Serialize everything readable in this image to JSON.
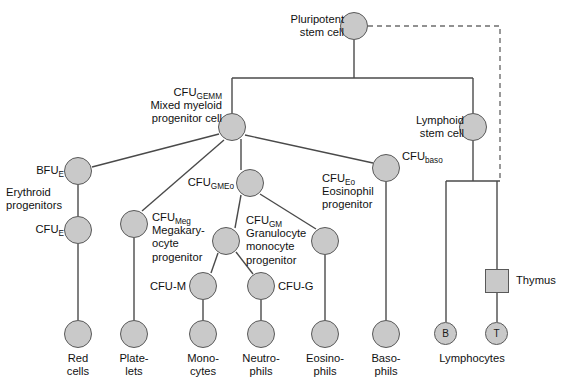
{
  "diagram": {
    "style": {
      "node_fill": "#c9c9c9",
      "node_stroke": "#595959",
      "line_color": "#4a4a4a",
      "dashed_line_color": "#6e6e6e",
      "background": "#ffffff"
    },
    "nodes": [
      {
        "id": "pluripotent",
        "label_main": "Pluripotent",
        "label_sub": "stem cell",
        "text": "Pluripotent\nstem cell",
        "shape": "circle",
        "cx": 354,
        "cy": 26,
        "r": 14,
        "label_x": 252,
        "label_y": 13,
        "label_w": 92,
        "align": "right"
      },
      {
        "id": "cfu-gemm",
        "text": "CFU",
        "subscript": "GEMM",
        "line2": "Mixed myeloid",
        "line3": "progenitor cell",
        "shape": "circle",
        "cx": 232,
        "cy": 127,
        "r": 14,
        "label_x": 112,
        "label_y": 86,
        "label_w": 110,
        "align": "right"
      },
      {
        "id": "lymphoid",
        "text": "Lymphoid\nstem cell",
        "shape": "circle",
        "cx": 473,
        "cy": 127,
        "r": 14,
        "label_x": 398,
        "label_y": 114,
        "label_w": 66,
        "align": "right"
      },
      {
        "id": "bfu-e",
        "text": "BFU",
        "subscript": "E",
        "shape": "circle",
        "cx": 78,
        "cy": 171,
        "r": 14,
        "label_x": 8,
        "label_y": 164,
        "label_w": 56,
        "align": "right"
      },
      {
        "id": "erythroid-note",
        "text": "Erythroid\nprogenitors",
        "shape": "none",
        "label_x": 6,
        "label_y": 186,
        "label_w": 80,
        "align": "left"
      },
      {
        "id": "cfu-e",
        "text": "CFU",
        "subscript": "E",
        "shape": "circle",
        "cx": 78,
        "cy": 230,
        "r": 14,
        "label_x": 8,
        "label_y": 223,
        "label_w": 56,
        "align": "right"
      },
      {
        "id": "cfu-meg",
        "text": "CFU",
        "subscript": "Meg",
        "line2": "Megakary-",
        "line3": "ocyte",
        "line4": "progenitor",
        "shape": "circle",
        "cx": 134,
        "cy": 224,
        "r": 14,
        "label_x": 152,
        "label_y": 211,
        "label_w": 78,
        "align": "left"
      },
      {
        "id": "cfu-gmeo",
        "text": "CFU",
        "subscript": "GMEo",
        "shape": "circle",
        "cx": 250,
        "cy": 183,
        "r": 14,
        "label_x": 148,
        "label_y": 176,
        "label_w": 86,
        "align": "right"
      },
      {
        "id": "cfu-gm",
        "text": "CFU",
        "subscript": "GM",
        "line2": "Granulocyte",
        "line3": "monocyte",
        "line4": "progenitor",
        "shape": "circle",
        "cx": 226,
        "cy": 241,
        "r": 14,
        "label_x": 246,
        "label_y": 214,
        "label_w": 84,
        "align": "left"
      },
      {
        "id": "cfu-eo",
        "text": "CFU",
        "subscript": "Eo",
        "line2": "Eosinophil",
        "line3": "progenitor",
        "shape": "circle",
        "cx": 325,
        "cy": 241,
        "r": 14,
        "label_x": 322,
        "label_y": 172,
        "label_w": 76,
        "align": "left"
      },
      {
        "id": "cfu-baso",
        "text": "CFU",
        "subscript": "baso",
        "shape": "circle",
        "cx": 386,
        "cy": 168,
        "r": 14,
        "label_x": 402,
        "label_y": 150,
        "label_w": 64,
        "align": "left"
      },
      {
        "id": "cfu-m",
        "text": "CFU-M",
        "shape": "circle",
        "cx": 203,
        "cy": 286,
        "r": 14,
        "label_x": 140,
        "label_y": 280,
        "label_w": 56,
        "align": "right"
      },
      {
        "id": "cfu-g",
        "text": "CFU-G",
        "shape": "circle",
        "cx": 261,
        "cy": 286,
        "r": 14,
        "label_x": 270,
        "label_y": 280,
        "label_w": 56,
        "align": "left"
      },
      {
        "id": "thymus",
        "text": "Thymus",
        "shape": "square",
        "cx": 497,
        "cy": 281,
        "r": 12,
        "label_x": 516,
        "label_y": 274,
        "label_w": 52,
        "align": "left"
      },
      {
        "id": "red-cells",
        "text": "Red\ncells",
        "shape": "circle",
        "cx": 78,
        "cy": 334,
        "r": 14,
        "label_x": 50,
        "label_y": 352,
        "label_w": 56,
        "align": "center"
      },
      {
        "id": "platelets",
        "text": "Plate-\nlets",
        "shape": "circle",
        "cx": 134,
        "cy": 334,
        "r": 14,
        "label_x": 106,
        "label_y": 352,
        "label_w": 56,
        "align": "center"
      },
      {
        "id": "monocytes",
        "text": "Mono-\ncytes",
        "shape": "circle",
        "cx": 203,
        "cy": 334,
        "r": 14,
        "label_x": 173,
        "label_y": 352,
        "label_w": 60,
        "align": "center"
      },
      {
        "id": "neutrophils",
        "text": "Neutro-\nphils",
        "shape": "circle",
        "cx": 261,
        "cy": 334,
        "r": 14,
        "label_x": 229,
        "label_y": 352,
        "label_w": 64,
        "align": "center"
      },
      {
        "id": "eosinophils",
        "text": "Eosino-\nphils",
        "shape": "circle",
        "cx": 325,
        "cy": 334,
        "r": 14,
        "label_x": 293,
        "label_y": 352,
        "label_w": 64,
        "align": "center"
      },
      {
        "id": "basophils",
        "text": "Baso-\nphils",
        "shape": "circle",
        "cx": 386,
        "cy": 334,
        "r": 14,
        "label_x": 358,
        "label_y": 352,
        "label_w": 56,
        "align": "center"
      },
      {
        "id": "b-cell",
        "text": "B",
        "shape": "circle-letter",
        "cx": 446,
        "cy": 334,
        "r": 11.5
      },
      {
        "id": "t-cell",
        "text": "T",
        "shape": "circle-letter",
        "cx": 497,
        "cy": 334,
        "r": 11.5
      },
      {
        "id": "lymphocytes-note",
        "text": "Lymphocytes",
        "shape": "none",
        "label_x": 433,
        "label_y": 352,
        "label_w": 78,
        "align": "center"
      }
    ],
    "edges": [
      {
        "from": "pluripotent",
        "to": "trunk-top",
        "type": "solid"
      },
      {
        "from": "trunk",
        "to": "cfu-gemm",
        "type": "solid"
      },
      {
        "from": "trunk",
        "to": "lymphoid",
        "type": "solid"
      },
      {
        "from": "cfu-gemm",
        "to": "bfu-e",
        "type": "solid"
      },
      {
        "from": "cfu-gemm",
        "to": "cfu-meg",
        "type": "solid"
      },
      {
        "from": "cfu-gemm",
        "to": "cfu-gmeo",
        "type": "solid"
      },
      {
        "from": "cfu-gemm",
        "to": "cfu-baso",
        "type": "solid"
      },
      {
        "from": "bfu-e",
        "to": "cfu-e",
        "type": "solid"
      },
      {
        "from": "cfu-e",
        "to": "red-cells",
        "type": "solid"
      },
      {
        "from": "cfu-meg",
        "to": "platelets",
        "type": "solid"
      },
      {
        "from": "cfu-gmeo",
        "to": "cfu-gm",
        "type": "solid"
      },
      {
        "from": "cfu-gmeo",
        "to": "cfu-eo",
        "type": "solid"
      },
      {
        "from": "cfu-gm",
        "to": "cfu-m",
        "type": "solid"
      },
      {
        "from": "cfu-gm",
        "to": "cfu-g",
        "type": "solid"
      },
      {
        "from": "cfu-m",
        "to": "monocytes",
        "type": "solid"
      },
      {
        "from": "cfu-g",
        "to": "neutrophils",
        "type": "solid"
      },
      {
        "from": "cfu-eo",
        "to": "eosinophils",
        "type": "solid"
      },
      {
        "from": "cfu-baso",
        "to": "basophils",
        "type": "solid"
      },
      {
        "from": "lymphoid",
        "to": "b-cell",
        "type": "solid"
      },
      {
        "from": "lymphoid",
        "to": "thymus",
        "type": "solid"
      },
      {
        "from": "thymus",
        "to": "t-cell",
        "type": "solid"
      },
      {
        "from": "pluripotent",
        "to": "t-cell-path",
        "type": "dashed"
      }
    ]
  }
}
